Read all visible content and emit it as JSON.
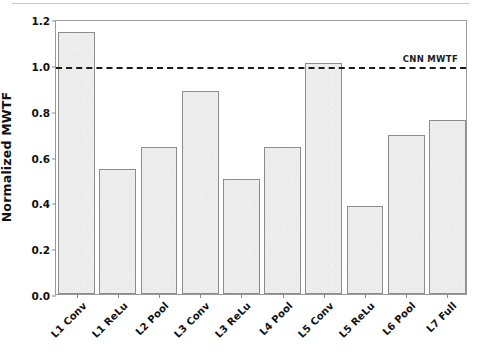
{
  "chart_data": {
    "type": "bar",
    "title": "",
    "xlabel": "",
    "ylabel": "Normalized MWTF",
    "categories": [
      "L1 Conv",
      "L1 ReLu",
      "L2 Pool",
      "L3 Conv",
      "L3 ReLu",
      "L4 Pool",
      "L5 Conv",
      "L5 ReLu",
      "L6 Pool",
      "L7 Full"
    ],
    "values": [
      1.145,
      0.545,
      0.64,
      0.885,
      0.5,
      0.64,
      1.01,
      0.385,
      0.695,
      0.76
    ],
    "ylim": [
      0.0,
      1.2
    ],
    "yticks": [
      "0.0",
      "0.2",
      "0.4",
      "0.6",
      "0.8",
      "1.0",
      "1.2"
    ],
    "ytick_values": [
      0.0,
      0.2,
      0.4,
      0.6,
      0.8,
      1.0,
      1.2
    ],
    "grid": false,
    "legend_position": "top-right-inline",
    "annotations": [
      {
        "name": "reference-line",
        "label": "CNN MWTF",
        "value": 1.0,
        "style": "dashed",
        "color": "#1a1a1a"
      }
    ],
    "bar_color": "#ededed",
    "bar_edge_color": "#8c8c8c"
  },
  "figure": {
    "caption": ""
  }
}
